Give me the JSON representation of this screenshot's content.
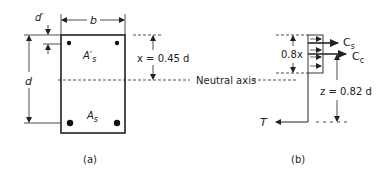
{
  "panel_a": {
    "caption": "(a)",
    "width_label": "b",
    "depth_label": "d",
    "cover_label": "d′",
    "compression_steel_label": "A′",
    "compression_steel_sub": "s",
    "tension_steel_label": "A",
    "tension_steel_sub": "s",
    "na_depth_label": "x = 0.45 d"
  },
  "panel_b": {
    "caption": "(b)",
    "neutral_axis_label": "Neutral axis",
    "block_depth_label": "0.8x",
    "steel_force_label": "C",
    "steel_force_sub": "s",
    "concrete_force_label": "C",
    "concrete_force_sub": "c",
    "lever_arm_label": "z = 0.82 d",
    "tension_label": "T"
  }
}
